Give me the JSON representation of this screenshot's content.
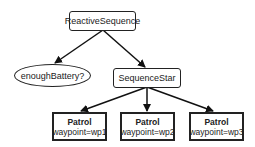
{
  "diagram": {
    "type": "behavior-tree",
    "nodes": {
      "root": {
        "label": "ReactiveSequence",
        "shape": "rounded-rect"
      },
      "condition": {
        "label": "enoughBattery?",
        "shape": "ellipse"
      },
      "sequence": {
        "label": "SequenceStar",
        "shape": "rounded-rect"
      },
      "patrol1": {
        "title": "Patrol",
        "param": "waypoint=wp1",
        "shape": "rect"
      },
      "patrol2": {
        "title": "Patrol",
        "param": "waypoint=wp2",
        "shape": "rect"
      },
      "patrol3": {
        "title": "Patrol",
        "param": "waypoint=wp3",
        "shape": "rect"
      }
    },
    "edges": [
      [
        "root",
        "condition"
      ],
      [
        "root",
        "sequence"
      ],
      [
        "sequence",
        "patrol1"
      ],
      [
        "sequence",
        "patrol2"
      ],
      [
        "sequence",
        "patrol3"
      ]
    ]
  }
}
